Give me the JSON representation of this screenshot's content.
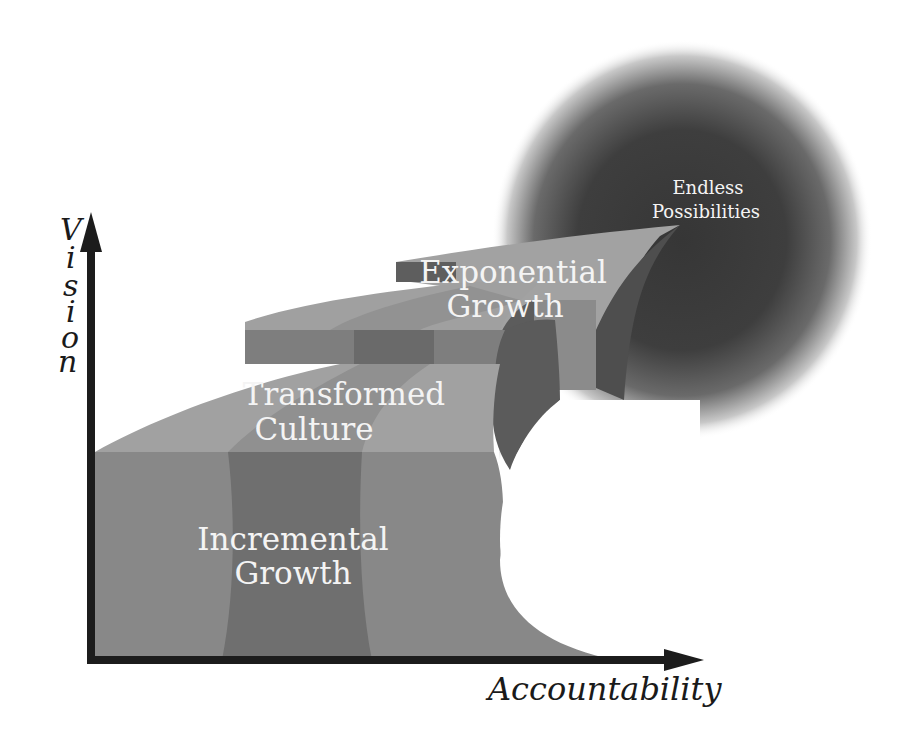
{
  "diagram": {
    "type": "staircase-growth-model",
    "axes": {
      "y_label_letters": [
        "V",
        "i",
        "s",
        "i",
        "o",
        "n"
      ],
      "y_label": "Vision",
      "x_label": "Accountability"
    },
    "stages": [
      {
        "id": "incremental",
        "line1": "Incremental",
        "line2": "Growth"
      },
      {
        "id": "transformed",
        "line1": "Transformed",
        "line2": "Culture"
      },
      {
        "id": "exponential",
        "line1": "Exponential",
        "line2": "Growth"
      }
    ],
    "endpoint": {
      "line1": "Endless",
      "line2": "Possibilities"
    },
    "colors": {
      "axis": "#1c1c1c",
      "face_light": "#8c8c8c",
      "face_mid": "#7a7a7a",
      "face_dark": "#5f5f5f",
      "top_light": "#a3a3a3",
      "glow_center": "#3a3a3a",
      "label_text": "#f4f4f4"
    }
  }
}
